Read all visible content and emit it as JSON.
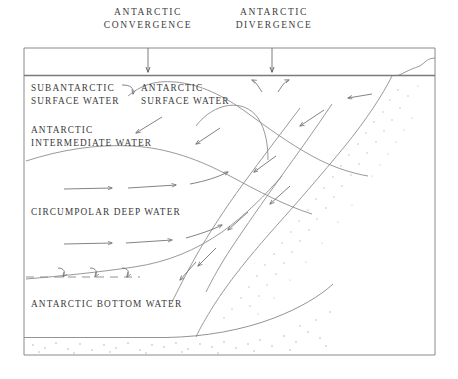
{
  "diagram": {
    "line_color": "#6d6d6d",
    "text_color": "#3a3a3a",
    "background": "#ffffff",
    "headers": [
      {
        "id": "convergence",
        "line1": "ANTARCTIC",
        "line2": "CONVERGENCE",
        "x": 148
      },
      {
        "id": "divergence",
        "line1": "ANTARCTIC",
        "line2": "DIVERGENCE",
        "x": 272
      }
    ],
    "water_masses": [
      {
        "id": "subantarctic-surface-water",
        "line1": "SUBANTARCTIC",
        "line2": "SURFACE WATER"
      },
      {
        "id": "antarctic-surface-water",
        "line1": "ANTARCTIC",
        "line2": "SURFACE WATER"
      },
      {
        "id": "antarctic-intermediate-water",
        "line1": "ANTARCTIC",
        "line2": "INTERMEDIATE WATER"
      },
      {
        "id": "circumpolar-deep-water",
        "line1": "CIRCUMPOLAR DEEP WATER",
        "line2": ""
      },
      {
        "id": "antarctic-bottom-water",
        "line1": "ANTARCTIC BOTTOM WATER",
        "line2": ""
      }
    ]
  }
}
